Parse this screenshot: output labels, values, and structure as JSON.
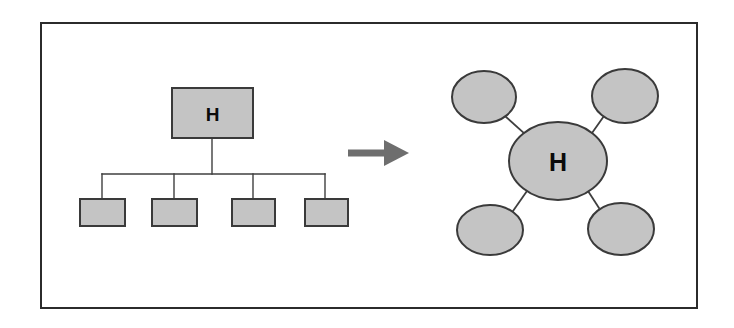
{
  "figure": {
    "background_color": "#ffffff",
    "frame": {
      "name": "figure-border",
      "x": 40,
      "y": 22,
      "width": 658,
      "height": 287,
      "border_color": "#2b2b2b",
      "border_width": 2
    }
  },
  "style": {
    "shape_fill": "#c4c4c4",
    "shape_stroke": "#3a3a3a",
    "shape_stroke_width": 2,
    "connector_color": "#3f3f3f",
    "connector_width": 1.4,
    "arrow_color": "#6e6e6e",
    "label_color": "#0b0b0b"
  },
  "left_diagram": {
    "name": "hierarchy-tree",
    "type": "tree",
    "root": {
      "label": "H",
      "x": 172,
      "y": 88,
      "width": 81,
      "height": 50
    },
    "bus": {
      "stem_x": 212,
      "stem_top": 138,
      "stem_bottom": 174,
      "bar_y": 174,
      "bar_left": 102,
      "bar_right": 325,
      "drop_bottom": 199
    },
    "children": [
      {
        "label": "",
        "x": 80,
        "y": 199,
        "width": 45,
        "height": 27,
        "drop_x": 102
      },
      {
        "label": "",
        "x": 152,
        "y": 199,
        "width": 45,
        "height": 27,
        "drop_x": 174
      },
      {
        "label": "",
        "x": 232,
        "y": 199,
        "width": 43,
        "height": 27,
        "drop_x": 253
      },
      {
        "label": "",
        "x": 305,
        "y": 199,
        "width": 43,
        "height": 27,
        "drop_x": 325
      }
    ]
  },
  "transform_arrow": {
    "name": "transformation-arrow",
    "direction": "right",
    "shaft_x1": 348,
    "shaft_x2": 387,
    "shaft_y": 153,
    "shaft_thickness": 7,
    "head_x1": 384,
    "head_x2": 409,
    "head_half_height": 13
  },
  "right_diagram": {
    "name": "hub-and-spoke-network",
    "type": "hub-spoke",
    "hub": {
      "label": "H",
      "cx": 558,
      "cy": 161,
      "rx": 49,
      "ry": 39
    },
    "satellites": [
      {
        "name": "satellite-top-left",
        "label": "",
        "cx": 484,
        "cy": 97,
        "rx": 32,
        "ry": 26
      },
      {
        "name": "satellite-top-right",
        "label": "",
        "cx": 625,
        "cy": 96,
        "rx": 33,
        "ry": 27
      },
      {
        "name": "satellite-bottom-left",
        "label": "",
        "cx": 490,
        "cy": 230,
        "rx": 33,
        "ry": 25
      },
      {
        "name": "satellite-bottom-right",
        "label": "",
        "cx": 621,
        "cy": 229,
        "rx": 33,
        "ry": 26
      }
    ],
    "spokes": [
      {
        "name": "spoke-top-left",
        "x1": 506,
        "y1": 117,
        "x2": 525,
        "y2": 134
      },
      {
        "name": "spoke-top-right",
        "x1": 604,
        "y1": 116,
        "x2": 592,
        "y2": 133
      },
      {
        "name": "spoke-bottom-left",
        "x1": 513,
        "y1": 211,
        "x2": 527,
        "y2": 191
      },
      {
        "name": "spoke-bottom-right",
        "x1": 599,
        "y1": 208,
        "x2": 588,
        "y2": 191
      }
    ]
  }
}
